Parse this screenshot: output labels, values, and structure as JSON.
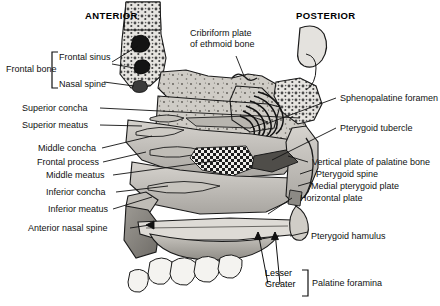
{
  "figure": {
    "orientation": {
      "anterior": "ANTERIOR",
      "posterior": "POSTERIOR"
    },
    "left_labels": [
      {
        "id": "frontal-bone",
        "text": "Frontal bone"
      },
      {
        "id": "frontal-sinus",
        "text": "Frontal sinus"
      },
      {
        "id": "nasal-spine",
        "text": "Nasal spine"
      },
      {
        "id": "superior-concha",
        "text": "Superior concha"
      },
      {
        "id": "superior-meatus",
        "text": "Superior meatus"
      },
      {
        "id": "middle-concha",
        "text": "Middle concha"
      },
      {
        "id": "frontal-process",
        "text": "Frontal process"
      },
      {
        "id": "middle-meatus",
        "text": "Middle meatus"
      },
      {
        "id": "inferior-concha",
        "text": "Inferior concha"
      },
      {
        "id": "inferior-meatus",
        "text": "Inferior meatus"
      },
      {
        "id": "anterior-nasal-spine",
        "text": "Anterior nasal spine"
      }
    ],
    "top_labels": [
      {
        "id": "cribriform-plate",
        "line1": "Cribriform plate",
        "line2": "of ethmoid bone"
      }
    ],
    "right_labels": [
      {
        "id": "sphenopalatine-foramen",
        "text": "Sphenopalatine foramen"
      },
      {
        "id": "pterygoid-tubercle",
        "text": "Pterygoid tubercle"
      },
      {
        "id": "vertical-plate-of-palatine-bone",
        "text": "Vertical plate of palatine bone"
      },
      {
        "id": "pterygoid-spine",
        "text": "Pterygoid spine"
      },
      {
        "id": "medial-pterygoid-plate",
        "text": "Medial pterygoid plate"
      },
      {
        "id": "horizontal-plate",
        "text": "Horizontal plate"
      },
      {
        "id": "pterygoid-hamulus",
        "text": "Pterygoid hamulus"
      }
    ],
    "bottom_group": {
      "id": "palatine-foramina",
      "item_1": "Lesser",
      "item_2": "Greater",
      "group_label": "Palatine foramina"
    },
    "colors": {
      "bone_light": "#d9d7d2",
      "bone_mid": "#bab7b1",
      "bone_dark": "#8e8b86",
      "cavity": "#2a2a2a",
      "outline": "#1a1a1a",
      "text": "#111111",
      "background": "#ffffff"
    }
  }
}
